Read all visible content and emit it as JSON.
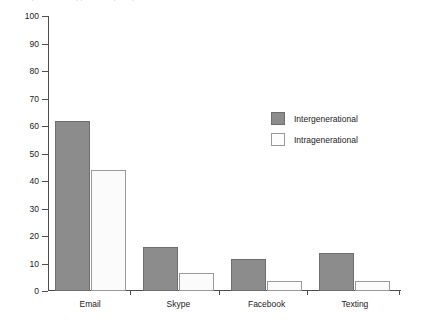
{
  "chart_data": {
    "type": "bar",
    "title": "",
    "xlabel": "",
    "ylabel": "Percentage",
    "ylim": [
      0,
      100
    ],
    "yticks": [
      0,
      10,
      20,
      30,
      40,
      50,
      60,
      70,
      80,
      90,
      100
    ],
    "ytick_labels": [
      "0",
      "10",
      "20",
      "30",
      "40",
      "50",
      "60",
      "70",
      "80",
      "90",
      "100"
    ],
    "grid": false,
    "legend_position": "upper right inside plot",
    "categories": [
      "Email",
      "Skype",
      "Facebook",
      "Texting"
    ],
    "series": [
      {
        "name": "Intergenerational",
        "color": "#8c8c8c",
        "border_color": "#6e6e6e",
        "values": [
          62,
          16,
          11.5,
          14
        ]
      },
      {
        "name": "Intragenerational",
        "color": "#fbfbfb",
        "border_color": "#9a9a9a",
        "values": [
          44,
          6.5,
          3.5,
          3.5
        ]
      }
    ]
  },
  "axes": {
    "y_axis_label": "Percentage",
    "y_min_label": "0",
    "y_max_label": "100"
  },
  "legend": {
    "items": [
      {
        "label": "Intergenerational",
        "swatch": "gray-filled-square"
      },
      {
        "label": "Intragenerational",
        "swatch": "white-outlined-square"
      }
    ]
  },
  "colors": {
    "intergenerational_fill": "#8c8c8c",
    "intragenerational_fill": "#fbfbfb",
    "bar_border": "#6e6e6e",
    "axis": "#4d4d4d",
    "text": "#1a1a1a",
    "background": "#ffffff"
  },
  "cropped_title": "Figure title cropped at top edge"
}
